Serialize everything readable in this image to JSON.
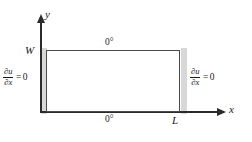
{
  "figure": {
    "axes": {
      "y_label": "y",
      "x_label": "x"
    },
    "domain": {
      "width_label": "W",
      "length_label": "L"
    },
    "boundary_conditions": {
      "top_edge": "0°",
      "bottom_edge": "0°",
      "left_edge": {
        "numerator": "∂u",
        "denominator": "∂x",
        "equals": "=",
        "value": "0"
      },
      "right_edge": {
        "numerator": "∂u",
        "denominator": "∂x",
        "equals": "=",
        "value": "0"
      }
    },
    "colors": {
      "axis": "#2b2b2b",
      "rectangle_border": "#4a4a4a",
      "insulation_band": "#d8d8d8",
      "background": "#ffffff",
      "text": "#1a1a1a"
    }
  }
}
